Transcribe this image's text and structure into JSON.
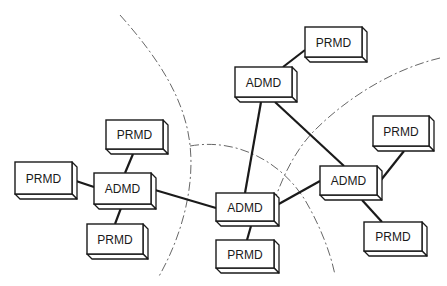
{
  "diagram": {
    "colors": {
      "stroke": "#1a1a1a",
      "boundary": "#555555",
      "background": "#ffffff"
    },
    "nodes": [
      {
        "id": "prmd-top",
        "type": "PRMD",
        "label": "PRMD",
        "x": 305,
        "y": 27,
        "w": 57,
        "h": 30
      },
      {
        "id": "admd-top",
        "type": "ADMD",
        "label": "ADMD",
        "x": 235,
        "y": 67,
        "w": 57,
        "h": 30
      },
      {
        "id": "prmd-right-top",
        "type": "PRMD",
        "label": "PRMD",
        "x": 373,
        "y": 116,
        "w": 56,
        "h": 30
      },
      {
        "id": "admd-right",
        "type": "ADMD",
        "label": "ADMD",
        "x": 320,
        "y": 166,
        "w": 57,
        "h": 29
      },
      {
        "id": "prmd-right-bottom",
        "type": "PRMD",
        "label": "PRMD",
        "x": 364,
        "y": 222,
        "w": 58,
        "h": 29
      },
      {
        "id": "admd-center",
        "type": "ADMD",
        "label": "ADMD",
        "x": 216,
        "y": 193,
        "w": 58,
        "h": 28
      },
      {
        "id": "prmd-center-bottom",
        "type": "PRMD",
        "label": "PRMD",
        "x": 216,
        "y": 240,
        "w": 58,
        "h": 28
      },
      {
        "id": "admd-left",
        "type": "ADMD",
        "label": "ADMD",
        "x": 94,
        "y": 173,
        "w": 57,
        "h": 31
      },
      {
        "id": "prmd-left-top",
        "type": "PRMD",
        "label": "PRMD",
        "x": 106,
        "y": 120,
        "w": 57,
        "h": 29
      },
      {
        "id": "prmd-far-left",
        "type": "PRMD",
        "label": "PRMD",
        "x": 15,
        "y": 162,
        "w": 57,
        "h": 32
      },
      {
        "id": "prmd-left-bottom",
        "type": "PRMD",
        "label": "PRMD",
        "x": 87,
        "y": 224,
        "w": 56,
        "h": 30
      }
    ],
    "links": [
      {
        "from": "admd-top",
        "to": "prmd-top",
        "x1": 283,
        "y1": 67,
        "x2": 305,
        "y2": 50
      },
      {
        "from": "admd-top",
        "to": "admd-center",
        "x1": 261,
        "y1": 102,
        "x2": 245,
        "y2": 193
      },
      {
        "from": "admd-top",
        "to": "admd-right",
        "x1": 275,
        "y1": 102,
        "x2": 344,
        "y2": 166
      },
      {
        "from": "admd-right",
        "to": "prmd-right-top",
        "x1": 381,
        "y1": 180,
        "x2": 404,
        "y2": 151
      },
      {
        "from": "admd-right",
        "to": "prmd-right-bottom",
        "x1": 362,
        "y1": 200,
        "x2": 382,
        "y2": 222
      },
      {
        "from": "admd-center",
        "to": "admd-right",
        "x1": 277,
        "y1": 205,
        "x2": 320,
        "y2": 181
      },
      {
        "from": "admd-center",
        "to": "prmd-center-bottom",
        "x1": 251,
        "y1": 226,
        "x2": 247,
        "y2": 240
      },
      {
        "from": "admd-left",
        "to": "admd-center",
        "x1": 155,
        "y1": 190,
        "x2": 216,
        "y2": 208
      },
      {
        "from": "admd-left",
        "to": "prmd-left-top",
        "x1": 125,
        "y1": 173,
        "x2": 133,
        "y2": 154
      },
      {
        "from": "admd-left",
        "to": "prmd-far-left",
        "x1": 94,
        "y1": 187,
        "x2": 76,
        "y2": 181
      },
      {
        "from": "admd-left",
        "to": "prmd-left-bottom",
        "x1": 121,
        "y1": 208,
        "x2": 115,
        "y2": 224
      }
    ],
    "boundaries": [
      {
        "id": "boundary-left",
        "path": "M120,15 C160,60 185,100 190,145 C195,190 180,240 158,278"
      },
      {
        "id": "boundary-middle",
        "path": "M190,146 C235,138 280,160 305,200 C318,222 330,250 335,275"
      },
      {
        "id": "boundary-right",
        "path": "M440,58 C390,70 345,100 315,130 C295,150 280,180 270,215"
      }
    ]
  }
}
